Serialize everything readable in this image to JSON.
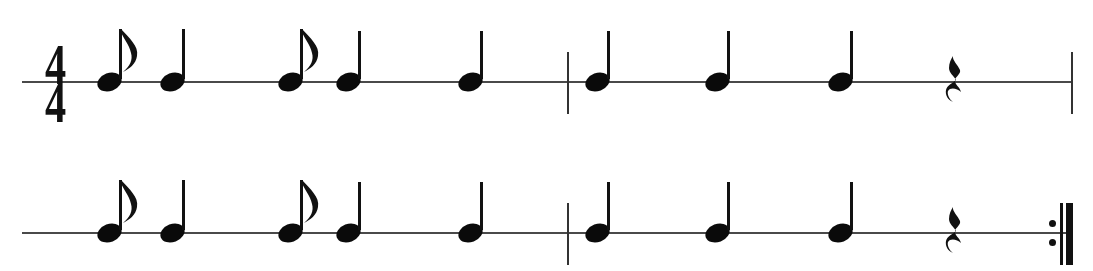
{
  "document": {
    "kind": "music-notation",
    "title": "Rhythm exercise",
    "notation_style": "single-line rhythm staff",
    "background_color": "#ffffff",
    "ink_color": "#111111",
    "staff_line_color": "#4a4a4a",
    "width": 1093,
    "height": 271
  },
  "time_signature": {
    "numerator": "4",
    "denominator": "4",
    "label": "4/4",
    "x": 55,
    "y": 82
  },
  "systems": [
    {
      "name": "system-1",
      "staff_y": 82,
      "staff_x_start": 22,
      "staff_x_end": 1072,
      "has_time_signature": true,
      "start_barline": null,
      "end_barline": "final-thin",
      "elements": [
        {
          "type": "note",
          "duration": "eighth",
          "label": "eighth note",
          "x": 109,
          "stem": "up",
          "flag": true
        },
        {
          "type": "note",
          "duration": "quarter",
          "label": "quarter note",
          "x": 172,
          "stem": "up",
          "flag": false
        },
        {
          "type": "note",
          "duration": "eighth",
          "label": "eighth note",
          "x": 290,
          "stem": "up",
          "flag": true
        },
        {
          "type": "note",
          "duration": "quarter",
          "label": "quarter note",
          "x": 348,
          "stem": "up",
          "flag": false
        },
        {
          "type": "note",
          "duration": "quarter",
          "label": "quarter note",
          "x": 470,
          "stem": "up",
          "flag": false
        },
        {
          "type": "barline",
          "label": "bar line",
          "x": 568
        },
        {
          "type": "note",
          "duration": "quarter",
          "label": "quarter note",
          "x": 597,
          "stem": "up",
          "flag": false
        },
        {
          "type": "note",
          "duration": "quarter",
          "label": "quarter note",
          "x": 717,
          "stem": "up",
          "flag": false
        },
        {
          "type": "note",
          "duration": "quarter",
          "label": "quarter note",
          "x": 840,
          "stem": "up",
          "flag": false
        },
        {
          "type": "rest",
          "duration": "quarter",
          "label": "quarter rest",
          "x": 955
        },
        {
          "type": "barline",
          "label": "bar line",
          "x": 1072
        }
      ]
    },
    {
      "name": "system-2",
      "staff_y": 233,
      "staff_x_start": 22,
      "staff_x_end": 1072,
      "has_time_signature": false,
      "start_barline": null,
      "end_barline": "repeat-end",
      "elements": [
        {
          "type": "note",
          "duration": "eighth",
          "label": "eighth note",
          "x": 109,
          "stem": "up",
          "flag": true
        },
        {
          "type": "note",
          "duration": "quarter",
          "label": "quarter note",
          "x": 172,
          "stem": "up",
          "flag": false
        },
        {
          "type": "note",
          "duration": "eighth",
          "label": "eighth note",
          "x": 290,
          "stem": "up",
          "flag": true
        },
        {
          "type": "note",
          "duration": "quarter",
          "label": "quarter note",
          "x": 348,
          "stem": "up",
          "flag": false
        },
        {
          "type": "note",
          "duration": "quarter",
          "label": "quarter note",
          "x": 470,
          "stem": "up",
          "flag": false
        },
        {
          "type": "barline",
          "label": "bar line",
          "x": 568
        },
        {
          "type": "note",
          "duration": "quarter",
          "label": "quarter note",
          "x": 597,
          "stem": "up",
          "flag": false
        },
        {
          "type": "note",
          "duration": "quarter",
          "label": "quarter note",
          "x": 717,
          "stem": "up",
          "flag": false
        },
        {
          "type": "note",
          "duration": "quarter",
          "label": "quarter note",
          "x": 840,
          "stem": "up",
          "flag": false
        },
        {
          "type": "rest",
          "duration": "quarter",
          "label": "quarter rest",
          "x": 955
        },
        {
          "type": "repeat_end",
          "label": "repeat end sign",
          "x": 1070,
          "dots_x": 1052,
          "thin_x": 1060,
          "thick_x": 1068
        }
      ]
    }
  ]
}
